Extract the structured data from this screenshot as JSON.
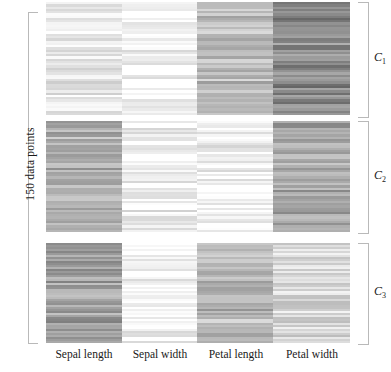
{
  "figure": {
    "left_axis_label": "150 data points",
    "cluster_labels": [
      "C",
      "C",
      "C"
    ],
    "cluster_subscripts": [
      "1",
      "2",
      "3"
    ]
  },
  "chart_data": {
    "type": "heatmap",
    "title": "",
    "xlabel": "",
    "ylabel": "150 data points",
    "grid": false,
    "legend": "none",
    "colorscale": "grayscale-light-to-dark",
    "columns": [
      "Sepal length",
      "Sepal width",
      "Petal length",
      "Petal width"
    ],
    "row_groups": [
      {
        "label": "C1",
        "n_rows": 50,
        "height_px": 114
      },
      {
        "label": "C2",
        "n_rows": 50,
        "height_px": 111
      },
      {
        "label": "C3",
        "n_rows": 50,
        "height_px": 100
      }
    ],
    "group_mean_levels": [
      {
        "group": "C1",
        "values": [
          0.91,
          0.97,
          0.74,
          0.55
        ]
      },
      {
        "group": "C2",
        "values": [
          0.7,
          0.94,
          0.96,
          0.66
        ]
      },
      {
        "group": "C3",
        "values": [
          0.63,
          0.95,
          0.72,
          0.84
        ]
      }
    ],
    "note": "values are normalized lightness 0=black 1=white as rendered"
  }
}
